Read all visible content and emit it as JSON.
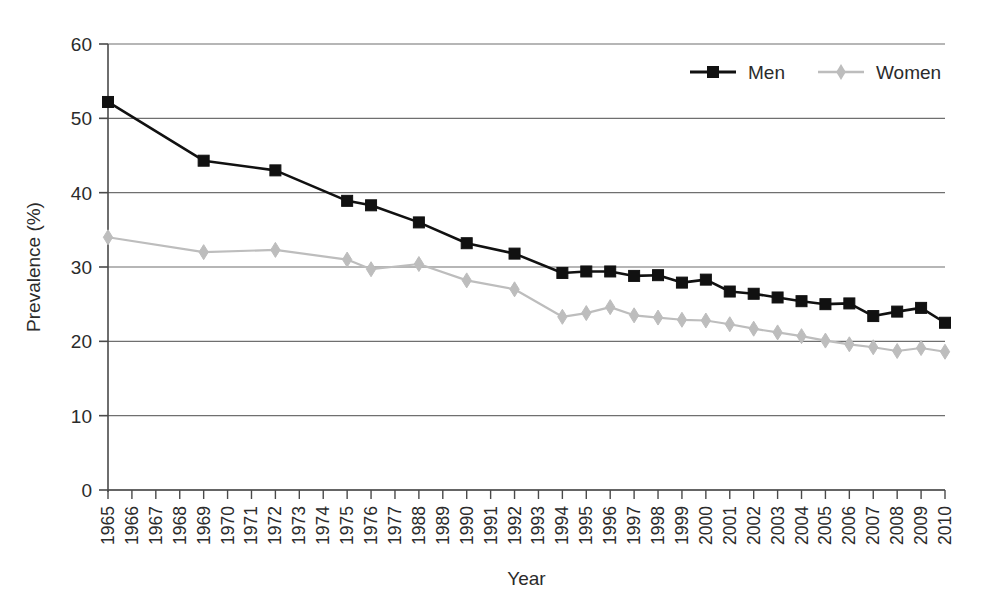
{
  "chart_data": {
    "type": "line",
    "title": "",
    "xlabel": "Year",
    "ylabel": "Prevalence (%)",
    "ylim": [
      0,
      60
    ],
    "ytick_step": 10,
    "yticks": [
      0,
      10,
      20,
      30,
      40,
      50,
      60
    ],
    "grid": true,
    "legend_position": "top-right",
    "categories": [
      "1965",
      "1966",
      "1967",
      "1968",
      "1969",
      "1970",
      "1971",
      "1972",
      "1973",
      "1974",
      "1975",
      "1976",
      "1977",
      "1988",
      "1989",
      "1990",
      "1991",
      "1992",
      "1993",
      "1994",
      "1995",
      "1996",
      "1997",
      "1998",
      "1999",
      "2000",
      "2001",
      "2002",
      "2003",
      "2004",
      "2005",
      "2006",
      "2007",
      "2008",
      "2009",
      "2010"
    ],
    "series": [
      {
        "name": "Men",
        "color": "#111111",
        "marker": "square",
        "values": [
          52.2,
          null,
          null,
          null,
          44.3,
          null,
          null,
          43.0,
          null,
          null,
          38.9,
          38.3,
          null,
          36.0,
          null,
          33.2,
          null,
          31.8,
          null,
          29.2,
          29.4,
          29.4,
          28.8,
          28.9,
          27.9,
          28.3,
          26.7,
          26.4,
          25.9,
          25.4,
          25.0,
          25.1,
          23.4,
          24.0,
          24.5,
          22.5
        ]
      },
      {
        "name": "Women",
        "color": "#bdbdbd",
        "marker": "diamond",
        "values": [
          34.0,
          null,
          null,
          null,
          32.0,
          null,
          null,
          32.3,
          null,
          null,
          31.0,
          29.7,
          null,
          30.4,
          null,
          28.2,
          null,
          27.0,
          null,
          23.3,
          23.8,
          24.6,
          23.5,
          23.2,
          22.9,
          22.8,
          22.3,
          21.7,
          21.2,
          20.7,
          20.1,
          19.6,
          19.2,
          18.7,
          19.1,
          18.6
        ]
      }
    ]
  },
  "legend": {
    "items": [
      {
        "label": "Men"
      },
      {
        "label": "Women"
      }
    ]
  },
  "axes": {
    "y": {
      "title": "Prevalence (%)",
      "ticks": [
        "0",
        "10",
        "20",
        "30",
        "40",
        "50",
        "60"
      ]
    },
    "x": {
      "title": "Year"
    }
  }
}
